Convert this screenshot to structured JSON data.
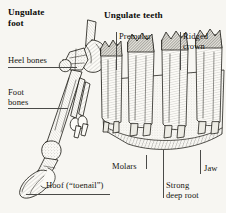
{
  "figure": {
    "background_color": "#f7f6f2",
    "ink_color": "#1a1a1a",
    "leader_color": "#4a4a48",
    "style": "black-and-white line engraving / scientific illustration"
  },
  "panels": {
    "foot": {
      "title": "Ungulate\nfoot",
      "labels": {
        "heel_bones": "Heel bones",
        "foot_bones": "Foot\nbones",
        "hoof": "Hoof (“toenail”)"
      }
    },
    "teeth": {
      "title": "Ungulate teeth",
      "labels": {
        "premolar": "Premolar",
        "ridged_crown": "Ridged\ncrown",
        "molars": "Molars",
        "jaw": "Jaw",
        "strong_deep_root": "Strong\ndeep root"
      }
    }
  }
}
